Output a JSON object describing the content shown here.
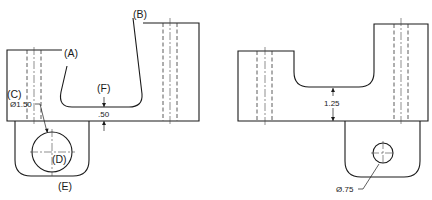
{
  "diagram": {
    "type": "orthographic-technical-drawing",
    "left_view": {
      "labels": {
        "A": "(A)",
        "B": "(B)",
        "C": "(C)",
        "D": "(D)",
        "E": "(E)",
        "F": "(F)"
      },
      "dimensions": {
        "hole_diameter": "Ø1.50",
        "slot_depth_gap": ".50"
      }
    },
    "right_view": {
      "dimensions": {
        "slot_height": "1.25",
        "hole_diameter": "Ø.75"
      }
    },
    "colors": {
      "line": "#1a1a1a",
      "background": "#ffffff"
    }
  }
}
